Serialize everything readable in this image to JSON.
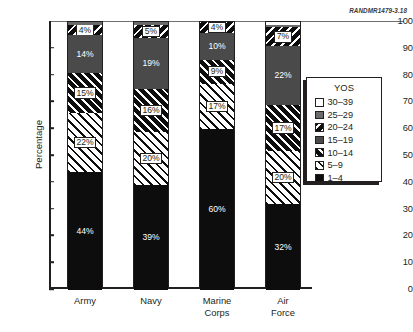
{
  "figure_code": "RANDMR1479-3.18",
  "chart_data": {
    "type": "bar",
    "subtype": "stacked-percentage",
    "title": "",
    "xlabel": "",
    "ylabel": "Percentage",
    "ylim": [
      0,
      100
    ],
    "ytick_step": 10,
    "yticks": [
      "100",
      "90",
      "80",
      "70",
      "60",
      "50",
      "40",
      "30",
      "20",
      "10",
      "0"
    ],
    "grid": false,
    "legend_position": "right",
    "legend_title": "YOS",
    "categories": [
      "Army",
      "Navy",
      "Marine Corps",
      "Air Force"
    ],
    "series": [
      {
        "name": "1–4",
        "values": [
          44,
          39,
          60,
          32
        ]
      },
      {
        "name": "5–9",
        "values": [
          22,
          20,
          17,
          20
        ]
      },
      {
        "name": "10–14",
        "values": [
          15,
          16,
          9,
          17
        ]
      },
      {
        "name": "15–19",
        "values": [
          14,
          19,
          10,
          22
        ]
      },
      {
        "name": "20–24",
        "values": [
          4,
          5,
          4,
          7
        ]
      },
      {
        "name": "25–29",
        "values": [
          1,
          1,
          0,
          1
        ]
      },
      {
        "name": "30–39",
        "values": [
          0,
          0,
          0,
          1
        ]
      }
    ],
    "legend_entries": [
      {
        "label": "30–39",
        "pattern": "white"
      },
      {
        "label": "25–29",
        "pattern": "gray"
      },
      {
        "label": "20–24",
        "pattern": "black-back-diagonal"
      },
      {
        "label": "15–19",
        "pattern": "dark-gray"
      },
      {
        "label": "10–14",
        "pattern": "black-forward-diagonal"
      },
      {
        "label": "5–9",
        "pattern": "white-black-diagonal"
      },
      {
        "label": "1–4",
        "pattern": "black"
      }
    ],
    "bars": [
      {
        "category": "Army",
        "category_lines": [
          "Army"
        ],
        "segments": [
          {
            "series": "1–4",
            "value": 44,
            "label": "44%"
          },
          {
            "series": "5–9",
            "value": 22,
            "label": "22%"
          },
          {
            "series": "10–14",
            "value": 15,
            "label": "15%"
          },
          {
            "series": "15–19",
            "value": 14,
            "label": "14%"
          },
          {
            "series": "20–24",
            "value": 4,
            "label": "4%"
          },
          {
            "series": "25–29",
            "value": 1,
            "label": ""
          },
          {
            "series": "30–39",
            "value": 0,
            "label": ""
          }
        ]
      },
      {
        "category": "Navy",
        "category_lines": [
          "Navy"
        ],
        "segments": [
          {
            "series": "1–4",
            "value": 39,
            "label": "39%"
          },
          {
            "series": "5–9",
            "value": 20,
            "label": "20%"
          },
          {
            "series": "10–14",
            "value": 16,
            "label": "16%"
          },
          {
            "series": "15–19",
            "value": 19,
            "label": "19%"
          },
          {
            "series": "20–24",
            "value": 5,
            "label": "5%"
          },
          {
            "series": "25–29",
            "value": 1,
            "label": ""
          },
          {
            "series": "30–39",
            "value": 0,
            "label": ""
          }
        ]
      },
      {
        "category": "Marine Corps",
        "category_lines": [
          "Marine",
          "Corps"
        ],
        "segments": [
          {
            "series": "1–4",
            "value": 60,
            "label": "60%"
          },
          {
            "series": "5–9",
            "value": 17,
            "label": "17%"
          },
          {
            "series": "10–14",
            "value": 9,
            "label": "9%"
          },
          {
            "series": "15–19",
            "value": 10,
            "label": "10%"
          },
          {
            "series": "20–24",
            "value": 4,
            "label": "4%"
          },
          {
            "series": "25–29",
            "value": 0,
            "label": ""
          },
          {
            "series": "30–39",
            "value": 0,
            "label": ""
          }
        ]
      },
      {
        "category": "Air Force",
        "category_lines": [
          "Air",
          "Force"
        ],
        "segments": [
          {
            "series": "1–4",
            "value": 32,
            "label": "32%"
          },
          {
            "series": "5–9",
            "value": 20,
            "label": "20%"
          },
          {
            "series": "10–14",
            "value": 17,
            "label": "17%"
          },
          {
            "series": "15–19",
            "value": 22,
            "label": "22%"
          },
          {
            "series": "20–24",
            "value": 7,
            "label": "7%"
          },
          {
            "series": "25–29",
            "value": 1,
            "label": ""
          },
          {
            "series": "30–39",
            "value": 1,
            "label": ""
          }
        ]
      }
    ]
  }
}
